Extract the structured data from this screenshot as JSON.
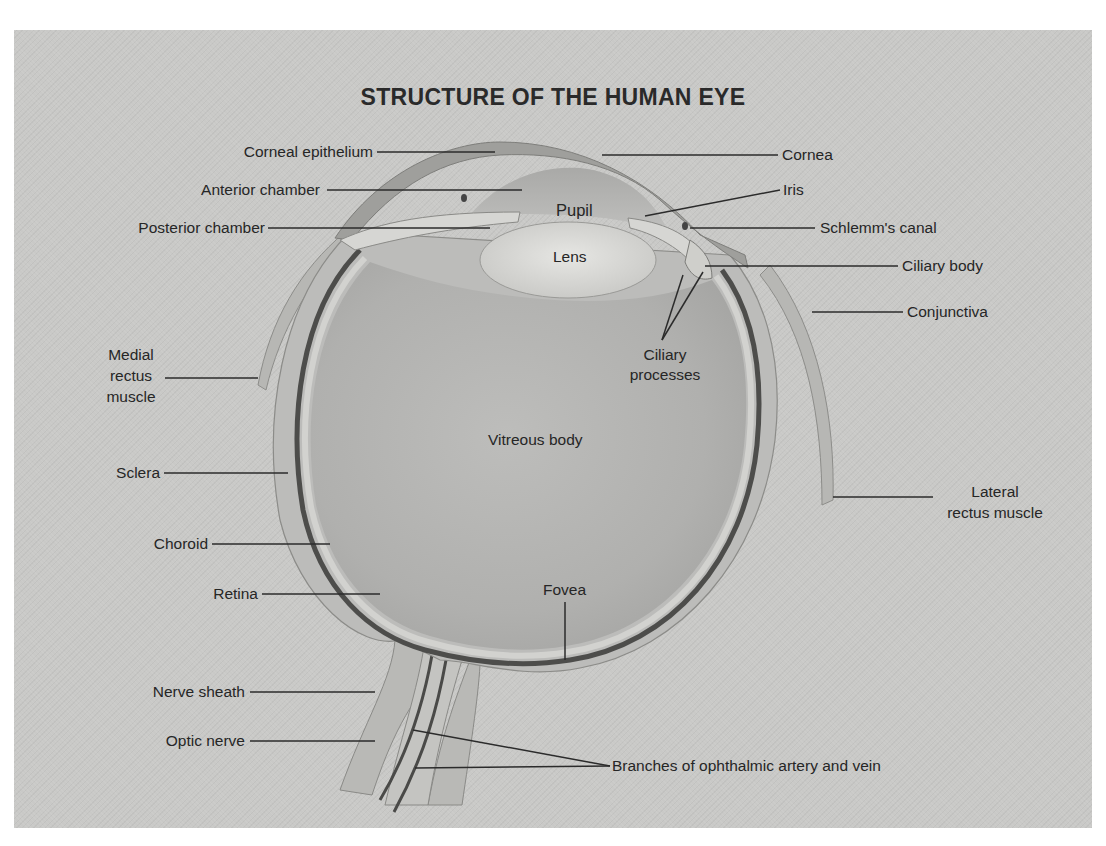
{
  "diagram": {
    "title": "STRUCTURE OF THE HUMAN EYE",
    "colors": {
      "background_panel": "#c9c9c7",
      "page": "#ffffff",
      "text": "#262626",
      "leader_line": "#2b2b2b"
    },
    "labels": {
      "corneal_epithelium": "Corneal epithelium",
      "cornea": "Cornea",
      "anterior_chamber": "Anterior chamber",
      "iris": "Iris",
      "pupil": "Pupil",
      "posterior_chamber": "Posterior chamber",
      "schlemms_canal": "Schlemm's canal",
      "lens": "Lens",
      "ciliary_body": "Ciliary body",
      "conjunctiva": "Conjunctiva",
      "ciliary_processes_line1": "Ciliary",
      "ciliary_processes_line2": "processes",
      "medial_rectus_line1": "Medial",
      "medial_rectus_line2": "rectus",
      "medial_rectus_line3": "muscle",
      "vitreous_body": "Vitreous body",
      "sclera": "Sclera",
      "lateral_rectus_line1": "Lateral",
      "lateral_rectus_line2": "rectus muscle",
      "choroid": "Choroid",
      "retina": "Retina",
      "fovea": "Fovea",
      "nerve_sheath": "Nerve sheath",
      "optic_nerve": "Optic nerve",
      "ophthalmic_branches": "Branches of ophthalmic artery and vein"
    }
  }
}
